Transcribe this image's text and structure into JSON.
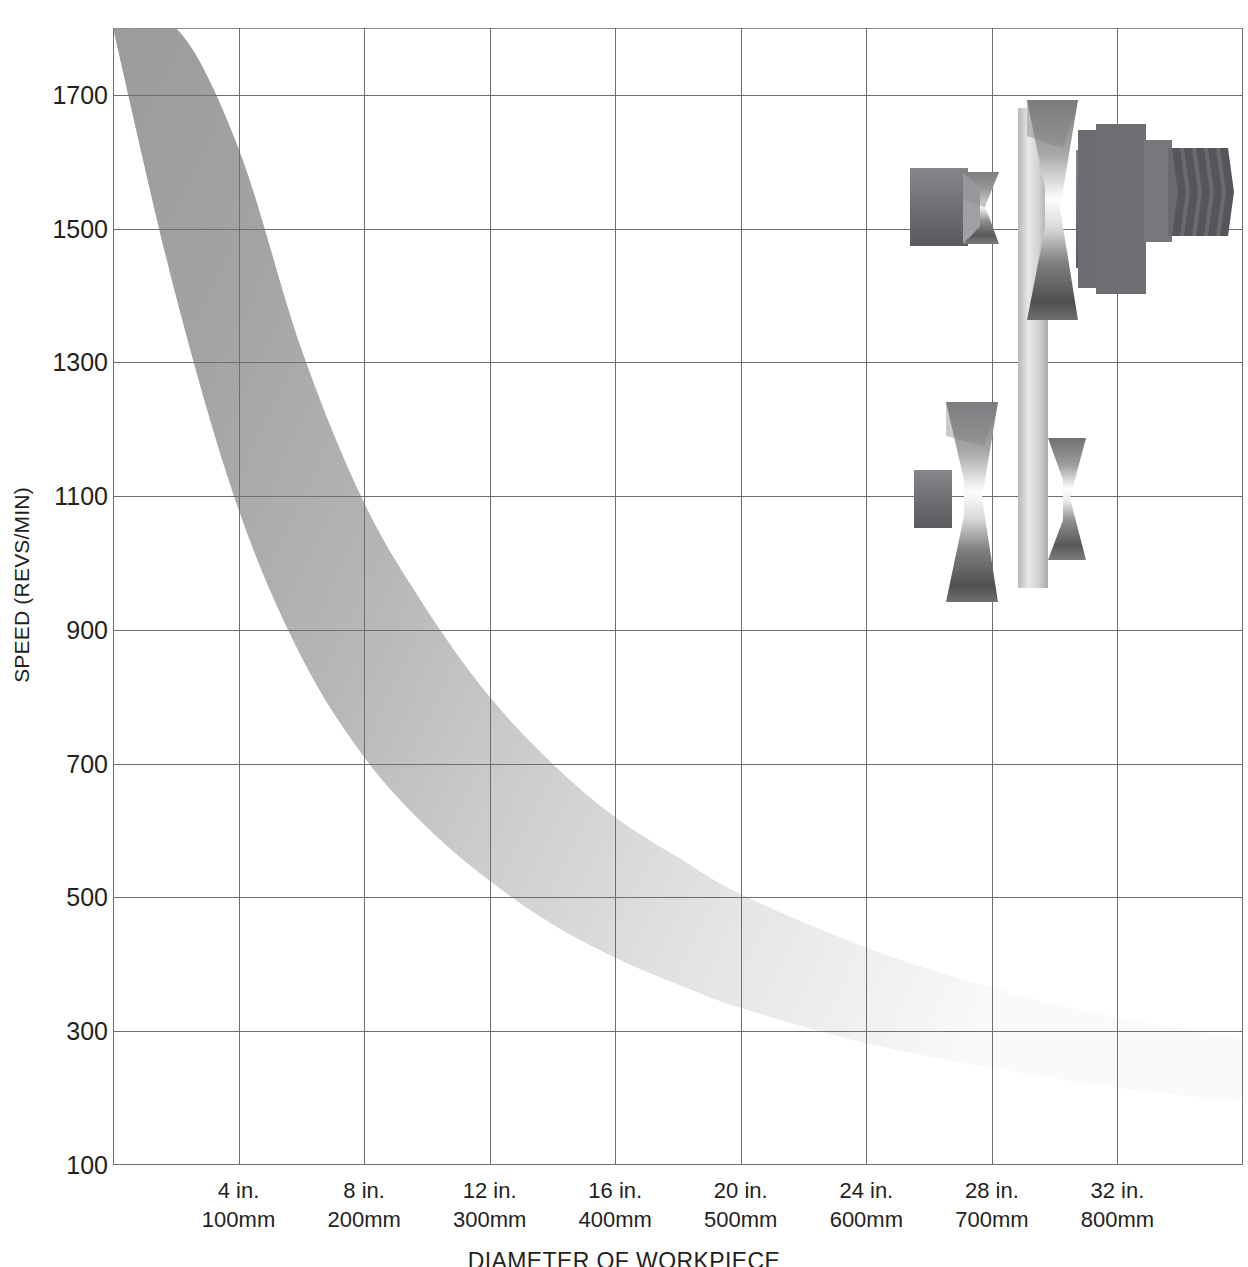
{
  "chart_data": {
    "type": "area",
    "title": "",
    "xlabel": "DIAMETER OF WORKPIECE",
    "ylabel": "SPEED (REVS/MIN)",
    "grid": true,
    "legend": "none",
    "ylim": [
      100,
      1800
    ],
    "yticks": [
      100,
      300,
      500,
      700,
      900,
      1100,
      1300,
      1500,
      1700
    ],
    "ytick_labels": [
      "100",
      "300",
      "500",
      "700",
      "900",
      "1100",
      "1300",
      "1500",
      "1700"
    ],
    "xlim_in": [
      0,
      36
    ],
    "xticks_in": [
      4,
      8,
      12,
      16,
      20,
      24,
      28,
      32
    ],
    "xtick_labels": [
      {
        "inches": "4 in.",
        "mm": "100mm"
      },
      {
        "inches": "8 in.",
        "mm": "200mm"
      },
      {
        "inches": "12 in.",
        "mm": "300mm"
      },
      {
        "inches": "16 in.",
        "mm": "400mm"
      },
      {
        "inches": "20 in.",
        "mm": "500mm"
      },
      {
        "inches": "24 in.",
        "mm": "600mm"
      },
      {
        "inches": "28 in.",
        "mm": "700mm"
      },
      {
        "inches": "32 in.",
        "mm": "800mm"
      }
    ],
    "series": [
      {
        "name": "upper-bound-speed",
        "x_in": [
          0,
          2,
          4,
          6,
          8,
          10,
          12,
          14,
          16,
          18,
          20,
          24,
          28,
          32,
          36
        ],
        "values": [
          1800,
          1800,
          1620,
          1320,
          1090,
          930,
          800,
          700,
          620,
          560,
          505,
          425,
          365,
          320,
          290
        ]
      },
      {
        "name": "lower-bound-speed",
        "x_in": [
          0,
          2,
          4,
          6,
          8,
          10,
          12,
          14,
          16,
          18,
          20,
          24,
          28,
          32,
          36
        ],
        "values": [
          1800,
          1400,
          1080,
          860,
          710,
          605,
          525,
          460,
          410,
          370,
          335,
          282,
          245,
          215,
          195
        ]
      }
    ],
    "band_fill_start_color": "#9b9b9b",
    "band_fill_end_color": "#f7f7f7",
    "grid_color": "#6d6e71"
  },
  "axes": {
    "y_title": "SPEED (REVS/MIN)",
    "x_title": "DIAMETER OF WORKPIECE"
  },
  "illustration": {
    "name": "lathe-spindle-and-pulley-assembly",
    "parts": [
      "spindle-shaft",
      "upper-step-pulley",
      "threaded-nose",
      "drive-belt",
      "lower-step-pulley"
    ]
  }
}
